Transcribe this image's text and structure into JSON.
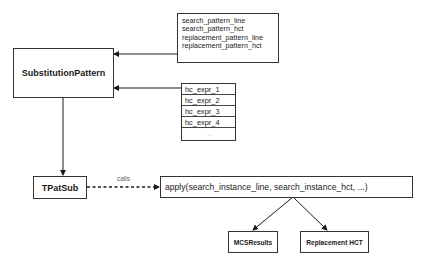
{
  "diagram": {
    "nodes": {
      "substitution_pattern": {
        "label": "SubstitutionPattern"
      },
      "pattern_fields": {
        "fields": [
          "search_pattern_line",
          "search_pattern_hct",
          "replacement_pattern_line",
          "replacement_pattern_hct"
        ]
      },
      "hc_expr_list": {
        "items": [
          "hc_expr_1",
          "hc_expr_2",
          "hc_expr_3",
          "hc_expr_4",
          "..."
        ]
      },
      "tpatsub": {
        "label": "TPatSub"
      },
      "apply_call": {
        "label": "apply(search_instance_line, search_instance_hct, ...)"
      },
      "mcs_results": {
        "label": "MCSResults"
      },
      "replacement_hct": {
        "label": "Replacement HCT"
      }
    },
    "edges": [
      {
        "from": "pattern_fields",
        "to": "substitution_pattern",
        "style": "solid"
      },
      {
        "from": "hc_expr_list",
        "to": "substitution_pattern",
        "style": "solid"
      },
      {
        "from": "substitution_pattern",
        "to": "tpatsub",
        "style": "solid"
      },
      {
        "from": "tpatsub",
        "to": "apply_call",
        "style": "dashed",
        "label": "calls"
      },
      {
        "from": "apply_call",
        "to": "mcs_results",
        "style": "solid"
      },
      {
        "from": "apply_call",
        "to": "replacement_hct",
        "style": "solid"
      }
    ],
    "colors": {
      "line": "#1a1a1a",
      "border": "#333333",
      "muted_text": "#666666"
    }
  }
}
